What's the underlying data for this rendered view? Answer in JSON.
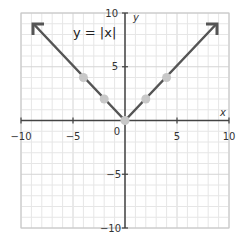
{
  "chart_data": {
    "type": "line",
    "title": "y = |x|",
    "equation_label": "y = |x|",
    "xlabel": "x",
    "ylabel": "y",
    "xlim": [
      -10,
      10
    ],
    "ylim": [
      -10,
      10
    ],
    "grid": true,
    "grid_step": 1,
    "x_ticks": [
      -10,
      -5,
      0,
      5,
      10
    ],
    "y_ticks": [
      -10,
      -5,
      5,
      10
    ],
    "x_tick_labels": [
      "−10",
      "−5",
      "0",
      "5",
      "10"
    ],
    "y_tick_labels": [
      "−10",
      "−5",
      "5",
      "10"
    ],
    "series": [
      {
        "name": "y = |x|",
        "x": [
          -9,
          0,
          9
        ],
        "y": [
          9,
          0,
          9
        ],
        "arrows_at_ends": true,
        "color": "#555555"
      }
    ],
    "points": [
      {
        "x": -4,
        "y": 4
      },
      {
        "x": -2,
        "y": 2
      },
      {
        "x": 0,
        "y": 0
      },
      {
        "x": 2,
        "y": 2
      },
      {
        "x": 4,
        "y": 4
      }
    ],
    "point_color": "#c8c8c8"
  },
  "labels": {
    "equation": "y = |x|",
    "x_axis": "x",
    "y_axis": "y",
    "origin": "0",
    "xt_m10": "−10",
    "xt_m5": "−5",
    "xt_5": "5",
    "xt_10": "10",
    "yt_10": "10",
    "yt_5": "5",
    "yt_m5": "−5",
    "yt_m10": "−10"
  }
}
